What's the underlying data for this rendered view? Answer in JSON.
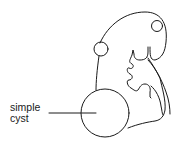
{
  "diagram": {
    "labels": [
      {
        "line1": "simple",
        "line2": "cyst"
      }
    ],
    "colors": {
      "stroke": "#1a1a1a",
      "background": "#ffffff"
    }
  }
}
